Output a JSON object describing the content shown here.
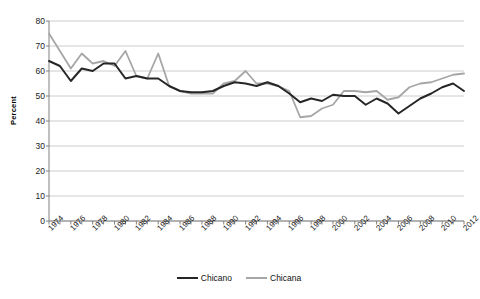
{
  "chart_data": {
    "type": "line",
    "title": "",
    "xlabel": "",
    "ylabel": "Percent",
    "ylim": [
      0,
      80
    ],
    "ytick_step": 10,
    "yticks": [
      0,
      10,
      20,
      30,
      40,
      50,
      60,
      70,
      80
    ],
    "xlim": [
      1974,
      2012
    ],
    "grid": "horizontal",
    "legend_position": "bottom-center",
    "x": [
      1974,
      1975,
      1976,
      1977,
      1978,
      1979,
      1980,
      1981,
      1982,
      1983,
      1984,
      1985,
      1986,
      1987,
      1988,
      1989,
      1990,
      1991,
      1992,
      1993,
      1994,
      1995,
      1996,
      1997,
      1998,
      1999,
      2000,
      2001,
      2002,
      2003,
      2004,
      2005,
      2006,
      2007,
      2008,
      2009,
      2010,
      2011,
      2012
    ],
    "xtick_labels": [
      "1974",
      "1976",
      "1978",
      "1980",
      "1982",
      "1984",
      "1986",
      "1988",
      "1990",
      "1992",
      "1994",
      "1996",
      "1998",
      "2000",
      "2002",
      "2004",
      "2006",
      "2008",
      "2010",
      "2012"
    ],
    "series": [
      {
        "name": "Chicano",
        "color": "#262626",
        "values": [
          64,
          62,
          56,
          61,
          60,
          63,
          63,
          57,
          58,
          57,
          57,
          54,
          52,
          51.5,
          51.5,
          52,
          54,
          55.5,
          55,
          54,
          55.5,
          54,
          51,
          47.5,
          49,
          48,
          50.5,
          50,
          50,
          46.5,
          49,
          47,
          43,
          46,
          49,
          51,
          53.5,
          55,
          52
        ]
      },
      {
        "name": "Chicana",
        "color": "#a6a6a6",
        "values": [
          75,
          68,
          61,
          67,
          63,
          64,
          62,
          68,
          58,
          57,
          67,
          54,
          52,
          51,
          51,
          51,
          55,
          56,
          60,
          55,
          55,
          54,
          52,
          41.5,
          42,
          45,
          46.5,
          52,
          52,
          51.5,
          52,
          48.5,
          49.5,
          53.5,
          55,
          55.5,
          57,
          58.5,
          59
        ]
      }
    ]
  },
  "legend": {
    "entries": [
      {
        "label": "Chicano",
        "color": "#262626"
      },
      {
        "label": "Chicana",
        "color": "#a6a6a6"
      }
    ]
  },
  "axis": {
    "y_title": "Percent"
  }
}
